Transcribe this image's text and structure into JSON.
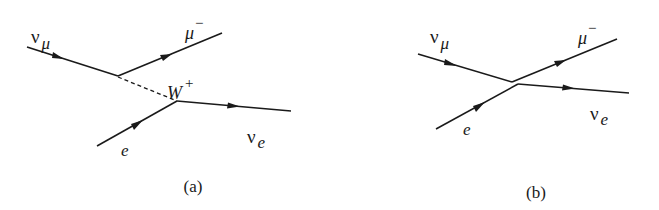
{
  "figure": {
    "panels": [
      {
        "id": "a",
        "caption": "(a)",
        "description": "Muon neutrino scatters on electron via W+ exchange",
        "particles": {
          "nu_mu": {
            "symbol": "ν",
            "sub": "μ"
          },
          "mu_minus": {
            "symbol": "μ",
            "sup": "−"
          },
          "e": {
            "symbol": "e"
          },
          "nu_e": {
            "symbol": "ν",
            "sub": "e"
          },
          "boson": {
            "symbol": "W",
            "sup": "+"
          }
        }
      },
      {
        "id": "b",
        "caption": "(b)",
        "description": "Effective four-fermion contact interaction",
        "particles": {
          "nu_mu": {
            "symbol": "ν",
            "sub": "μ"
          },
          "mu_minus": {
            "symbol": "μ",
            "sup": "−"
          },
          "e": {
            "symbol": "e"
          },
          "nu_e": {
            "symbol": "ν",
            "sub": "e"
          }
        }
      }
    ],
    "colors": {
      "ink": "#1a1a1a",
      "background": "#ffffff"
    }
  }
}
